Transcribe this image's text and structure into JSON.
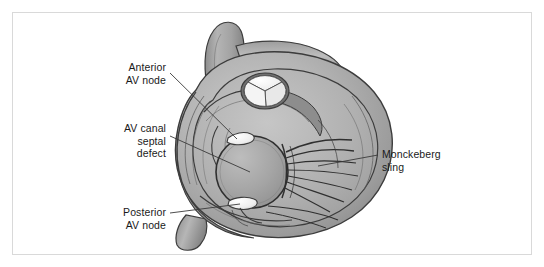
{
  "figure": {
    "domain": "medical-illustration",
    "background_color": "#ffffff",
    "frame_color": "#d9d9d9",
    "text_color": "#1a1a1a",
    "leader_line_color": "#3a3a3a",
    "palette": {
      "myocardium_light": "#bfbfbf",
      "myocardium_mid": "#9a9a9a",
      "myocardium_dark": "#7a7a7a",
      "outline": "#3c3c3c",
      "vessel_light": "#b2b2b2",
      "vessel_dark": "#8a8a8a",
      "defect_fill": "#a6a6a6",
      "node_white": "#f2f2f2",
      "valve_cusp_white": "#f4f4f4"
    }
  },
  "labels": {
    "anterior_av_node": "Anterior\nAV node",
    "av_canal_septal_defect": "AV canal\nseptal\ndefect",
    "posterior_av_node": "Posterior\nAV node",
    "monckeberg_sling": "Monckeberg\nsling"
  },
  "anatomy": {
    "parts": [
      "great-vessel-superior",
      "great-vessel-transverse",
      "great-vessel-inferior-left",
      "aortic-valve-cusps",
      "myocardial-wall-layers",
      "av-canal-septal-defect",
      "anterior-av-node",
      "posterior-av-node",
      "monckeberg-sling-chordae",
      "papillary-trabeculae"
    ]
  }
}
